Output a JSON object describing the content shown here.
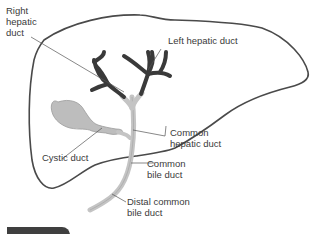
{
  "diagram": {
    "colors": {
      "outline": "#4a4a4a",
      "intrahepatic_ducts": "#3a3a3a",
      "extrahepatic_ducts": "#c4c4c4",
      "gallbladder": "#bdbdbd",
      "leader_line": "#555555",
      "label_text": "#3a3a3a",
      "caption_bar": "#3f3f3f"
    },
    "labels": {
      "right_hepatic_duct": "Right\nhepatic\nduct",
      "left_hepatic_duct": "Left hepatic duct",
      "cystic_duct": "Cystic duct",
      "common_hepatic_duct": "Common\nhepatic duct",
      "common_bile_duct": "Common\nbile duct",
      "distal_common_bile_duct": "Distal common\nbile duct"
    }
  }
}
